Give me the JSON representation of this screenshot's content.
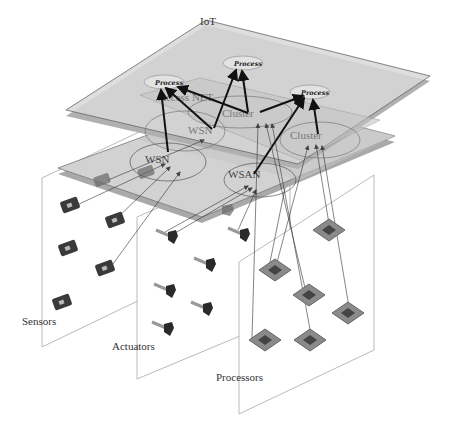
{
  "diagram": {
    "layers": {
      "iot": {
        "label": "IoT"
      },
      "access_net": {
        "label": "Access NET"
      }
    },
    "process_nodes": [
      {
        "label": "Process"
      },
      {
        "label": "Process"
      },
      {
        "label": "Process"
      }
    ],
    "clusters": [
      {
        "label": "Cluster"
      },
      {
        "label": "Cluster"
      }
    ],
    "networks": [
      {
        "label": "WSN"
      },
      {
        "label": "WSN"
      },
      {
        "label": "WSAN"
      }
    ],
    "panels": {
      "sensors": {
        "label": "Sensors",
        "count": 5
      },
      "actuators": {
        "label": "Actuators",
        "count": 6
      },
      "processors": {
        "label": "Processors",
        "count": 6
      }
    },
    "colors": {
      "layer_fill": "#d6d6d6",
      "layer_edge": "#8a8a8a",
      "inner_fill": "#c4c4c4",
      "arrow": "#111111",
      "thin_line": "#333333",
      "panel_edge": "#a0a0a0"
    }
  }
}
